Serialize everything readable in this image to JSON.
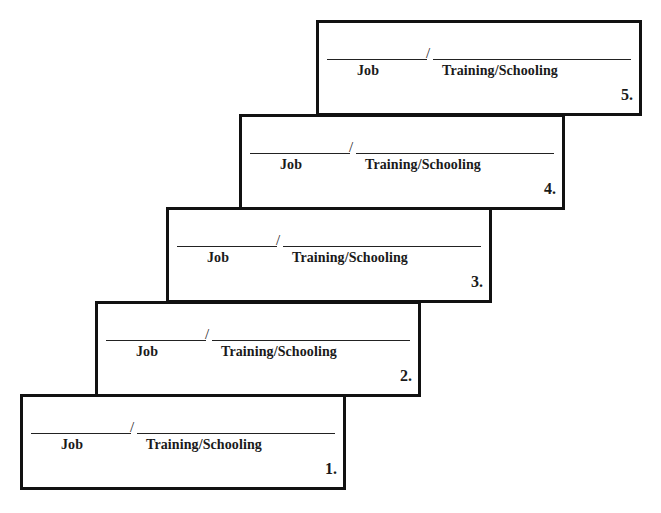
{
  "steps": [
    {
      "number": "1.",
      "job_label": "Job",
      "separator": "/",
      "training_label": "Training/Schooling",
      "job_value": "",
      "training_value": ""
    },
    {
      "number": "2.",
      "job_label": "Job",
      "separator": "/",
      "training_label": "Training/Schooling",
      "job_value": "",
      "training_value": ""
    },
    {
      "number": "3.",
      "job_label": "Job",
      "separator": "/",
      "training_label": "Training/Schooling",
      "job_value": "",
      "training_value": ""
    },
    {
      "number": "4.",
      "job_label": "Job",
      "separator": "/",
      "training_label": "Training/Schooling",
      "job_value": "",
      "training_value": ""
    },
    {
      "number": "5.",
      "job_label": "Job",
      "separator": "/",
      "training_label": "Training/Schooling",
      "job_value": "",
      "training_value": ""
    }
  ],
  "colors": {
    "border": "#111111",
    "background": "#ffffff",
    "text": "#1a1a1a"
  }
}
